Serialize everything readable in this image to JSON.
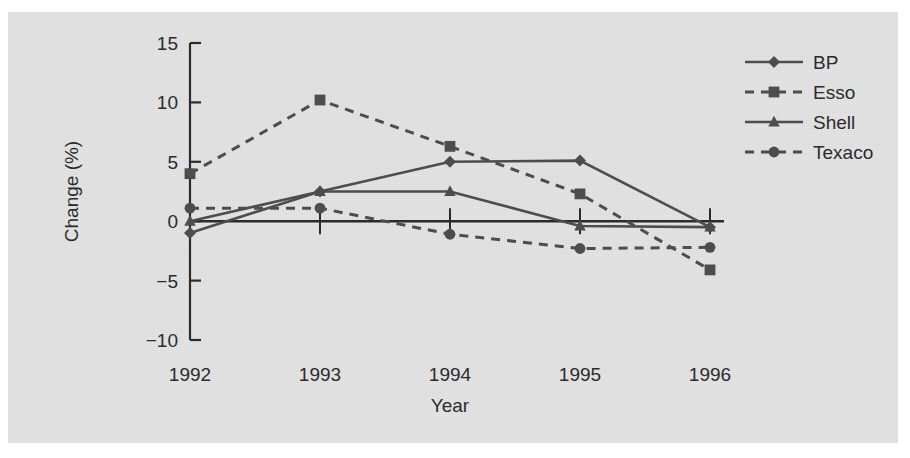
{
  "chart_data": {
    "type": "line",
    "title": "",
    "subtitle": "",
    "xlabel": "Year",
    "ylabel": "Change (%)",
    "categories": [
      "1992",
      "1993",
      "1994",
      "1995",
      "1996"
    ],
    "x": [
      1992,
      1993,
      1994,
      1995,
      1996
    ],
    "xlim": [
      1992,
      1996
    ],
    "ylim": [
      -10,
      15
    ],
    "yticks": [
      15,
      10,
      5,
      0,
      -5,
      -10
    ],
    "ytick_labels": [
      "15",
      "10",
      "5",
      "0",
      "−5",
      "−10"
    ],
    "xticks": [
      1992,
      1993,
      1994,
      1995,
      1996
    ],
    "xtick_labels": [
      "1992",
      "1993",
      "1994",
      "1995",
      "1996"
    ],
    "grid": false,
    "legend_position": "top-right",
    "series": [
      {
        "name": "BP",
        "marker": "diamond",
        "linestyle": "solid",
        "values": [
          -1.0,
          2.5,
          5.0,
          5.1,
          -0.5
        ]
      },
      {
        "name": "Esso",
        "marker": "square",
        "linestyle": "dashed",
        "values": [
          4.0,
          10.2,
          6.3,
          2.3,
          -4.1
        ]
      },
      {
        "name": "Shell",
        "marker": "triangle",
        "linestyle": "solid",
        "values": [
          0.0,
          2.5,
          2.5,
          -0.4,
          -0.5
        ]
      },
      {
        "name": "Texaco",
        "marker": "circle",
        "linestyle": "dashed",
        "values": [
          1.1,
          1.1,
          -1.1,
          -2.3,
          -2.2
        ]
      }
    ],
    "colors": {
      "line": "#4d4d4d",
      "marker": "#4d4d4d",
      "axis": "#2b2b2b",
      "panel_background": "#e4e4e4",
      "page_background": "#ffffff",
      "text": "#2b2b2b"
    }
  }
}
